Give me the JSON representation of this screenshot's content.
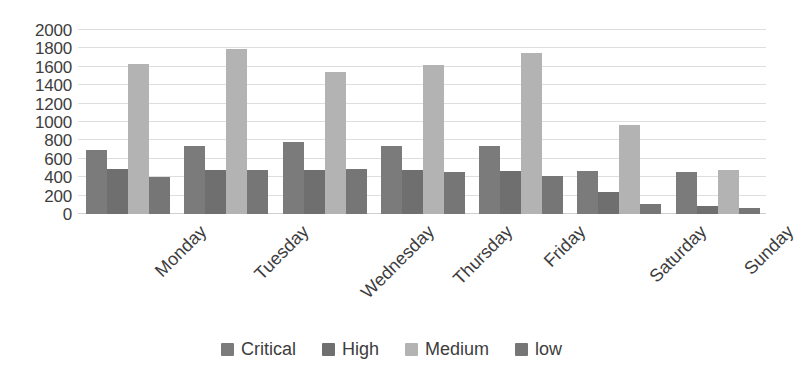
{
  "chart_data": {
    "type": "bar",
    "title": "",
    "subtitle": "",
    "xlabel": "",
    "ylabel": "",
    "categories": [
      "Monday",
      "Tuesday",
      "Wednesday",
      "Thursday",
      "Friday",
      "Saturday",
      "Sunday"
    ],
    "series": [
      {
        "name": "Critical",
        "color": "#7b7b7b",
        "values": [
          700,
          740,
          780,
          740,
          740,
          470,
          460
        ]
      },
      {
        "name": "High",
        "color": "#6f6f6f",
        "values": [
          490,
          480,
          480,
          480,
          470,
          240,
          90
        ]
      },
      {
        "name": "Medium",
        "color": "#b3b3b3",
        "values": [
          1630,
          1790,
          1540,
          1620,
          1750,
          970,
          480
        ]
      },
      {
        "name": "low",
        "color": "#767676",
        "values": [
          400,
          480,
          490,
          460,
          410,
          110,
          60
        ]
      }
    ],
    "ylim": [
      0,
      2000
    ],
    "y_ticks": [
      0,
      200,
      400,
      600,
      800,
      1000,
      1200,
      1400,
      1600,
      1800,
      2000
    ],
    "y_tick_labels": [
      "0",
      "200",
      "400",
      "600",
      "800",
      "1000",
      "1200",
      "1400",
      "1600",
      "1800",
      "2000"
    ],
    "grid": true,
    "grid_color": "#dedede",
    "legend_position": "bottom",
    "x_tick_rotation": -45,
    "background": "#ffffff",
    "text_color": "#3d3d3d"
  }
}
